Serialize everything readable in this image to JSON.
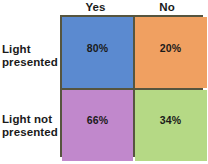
{
  "figure": {
    "type": "2x2-contingency-matrix",
    "column_headers": [
      "Yes",
      "No"
    ],
    "row_labels": [
      {
        "line1": "Light",
        "line2": "presented"
      },
      {
        "line1": "Light not",
        "line2": "presented"
      }
    ],
    "cells": [
      {
        "row": "Light presented",
        "column": "Yes",
        "value": "80%",
        "color": "#5b8ad0"
      },
      {
        "row": "Light presented",
        "column": "No",
        "value": "20%",
        "color": "#f0a061"
      },
      {
        "row": "Light not presented",
        "column": "Yes",
        "value": "66%",
        "color": "#c188cc"
      },
      {
        "row": "Light not presented",
        "column": "No",
        "value": "34%",
        "color": "#b5d985"
      }
    ],
    "border_color": "#56553f",
    "text_color": "#1a1a1a",
    "background_color": "#ffffff"
  },
  "chart_data": {
    "type": "heatmap",
    "title": "",
    "xlabel": "",
    "ylabel": "",
    "categories": [
      "Yes",
      "No"
    ],
    "rows": [
      "Light presented",
      "Light not presented"
    ],
    "series": [
      {
        "name": "Light presented",
        "values": [
          80,
          20
        ]
      },
      {
        "name": "Light not presented",
        "values": [
          66,
          34
        ]
      }
    ],
    "value_labels": [
      [
        "80%",
        "20%"
      ],
      [
        "66%",
        "34%"
      ]
    ],
    "cell_colors": [
      [
        "#5b8ad0",
        "#f0a061"
      ],
      [
        "#c188cc",
        "#b5d985"
      ]
    ],
    "units": "percent",
    "legend": "none",
    "grid": true
  }
}
